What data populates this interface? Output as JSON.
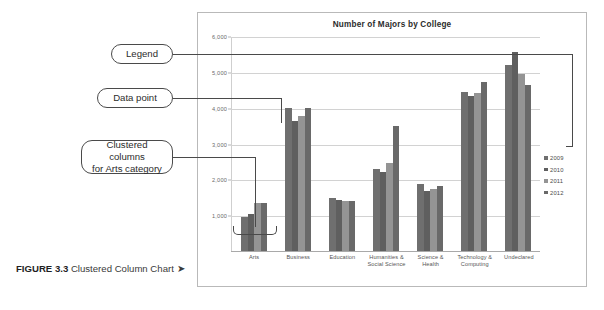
{
  "figure": {
    "label": "FIGURE 3.3",
    "title": "Clustered Column Chart",
    "arrow": "➤"
  },
  "callouts": {
    "legend": "Legend",
    "data_point": "Data point",
    "clustered_columns_line1": "Clustered columns",
    "clustered_columns_line2": "for Arts category"
  },
  "chart_data": {
    "type": "bar",
    "title": "Number of Majors by College",
    "xlabel": "",
    "ylabel": "",
    "ylim": [
      0,
      6000
    ],
    "yticks": [
      1000,
      2000,
      3000,
      4000,
      5000,
      6000
    ],
    "ytick_labels": [
      "1,000",
      "2,000",
      "3,000",
      "4,000",
      "5,000",
      "6,000"
    ],
    "grid": true,
    "legend_position": "right",
    "categories": [
      "Arts",
      "Business",
      "Education",
      "Humanities &\nSocial Science",
      "Science &\nHealth",
      "Technology &\nComputing",
      "Undeclared"
    ],
    "category_lines": [
      [
        "Arts"
      ],
      [
        "Business"
      ],
      [
        "Education"
      ],
      [
        "Humanities &",
        "Social Science"
      ],
      [
        "Science &",
        "Health"
      ],
      [
        "Technology &",
        "Computing"
      ],
      [
        "Undeclared"
      ]
    ],
    "series": [
      {
        "name": "2009",
        "color": "#6f6f6f",
        "values": [
          950,
          3980,
          1480,
          2280,
          1880,
          4450,
          5180
        ]
      },
      {
        "name": "2010",
        "color": "#5f5f5f",
        "values": [
          1020,
          3640,
          1420,
          2200,
          1680,
          4320,
          5550
        ]
      },
      {
        "name": "2011",
        "color": "#949494",
        "values": [
          1350,
          3780,
          1400,
          2450,
          1740,
          4400,
          4950
        ]
      },
      {
        "name": "2012",
        "color": "#696969",
        "values": [
          1340,
          4000,
          1400,
          3480,
          1820,
          4720,
          4620
        ]
      }
    ]
  }
}
